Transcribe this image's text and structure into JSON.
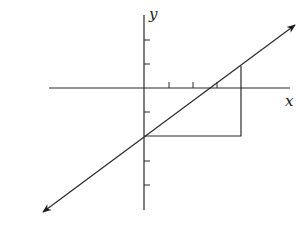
{
  "diagram": {
    "type": "coordinate-plane",
    "axes": {
      "x_label": "x",
      "y_label": "y",
      "origin_px": [
        144,
        88
      ],
      "unit_px": 24.3,
      "x_ticks": [
        1,
        2,
        3
      ],
      "y_ticks": [
        2,
        1,
        -1,
        -2,
        -3,
        -4
      ]
    },
    "line": {
      "description": "straight line with arrows at both ends",
      "from_px": [
        43,
        212
      ],
      "to_px": [
        295,
        25
      ],
      "y_intercept": -2,
      "x_intercept": 2.6
    },
    "slope_triangle": {
      "description": "right-angle path from y-intercept horizontally right then vertically up to the line",
      "horizontal_run": 4,
      "vertical_rise": 3,
      "points_px": [
        [
          144,
          136
        ],
        [
          241,
          136
        ],
        [
          241,
          66
        ]
      ]
    },
    "colors": {
      "stroke": "#2a2a2a",
      "background": "#ffffff"
    }
  }
}
